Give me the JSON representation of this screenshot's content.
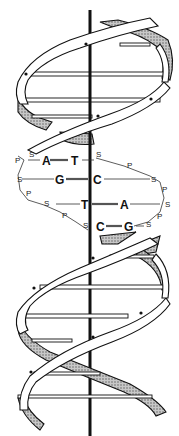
{
  "diagram": {
    "base_pairs": [
      {
        "left": "A",
        "right": "T"
      },
      {
        "left": "G",
        "right": "C"
      },
      {
        "left": "T",
        "right": "A"
      },
      {
        "left": "C",
        "right": "G"
      }
    ],
    "backbone": {
      "sugar_label": "S",
      "phosphate_label": "P"
    },
    "colors": {
      "ink": "#111111",
      "background": "#ffffff",
      "hatch": "#9a9a9a"
    }
  }
}
